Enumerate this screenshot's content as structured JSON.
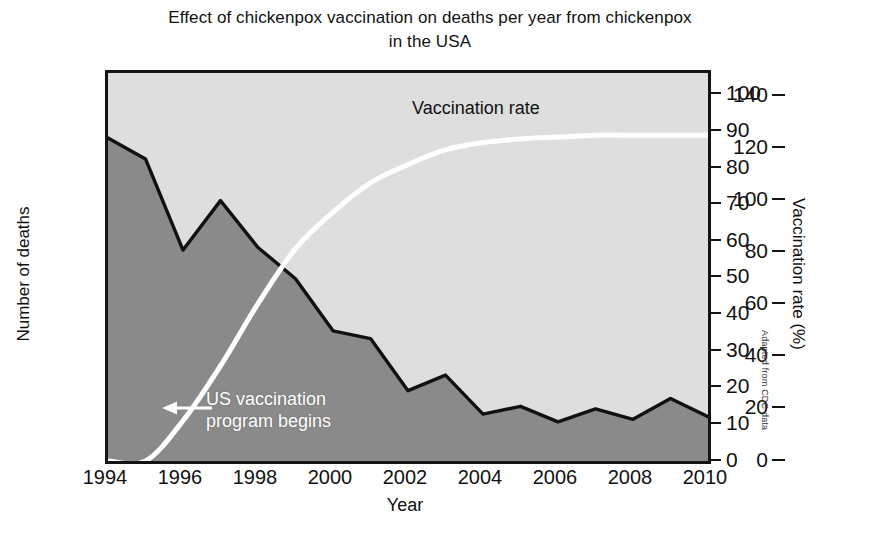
{
  "chart_data": {
    "type": "area",
    "title": "Effect of chickenpox vaccination on deaths per year from chickenpox in the USA",
    "title_line1": "Effect of chickenpox vaccination on deaths per year from chickenpox",
    "title_line2": "in the USA",
    "xlabel": "Year",
    "ylabel": "Number of deaths",
    "y2label": "Vaccination rate (%)",
    "x": [
      1994,
      1995,
      1996,
      1997,
      1998,
      1999,
      2000,
      2001,
      2002,
      2003,
      2004,
      2005,
      2006,
      2007,
      2008,
      2009,
      2010
    ],
    "xticks": [
      "1994",
      "1996",
      "1998",
      "2000",
      "2002",
      "2004",
      "2006",
      "2008",
      "2010"
    ],
    "xtick_values": [
      1994,
      1996,
      1998,
      2000,
      2002,
      2004,
      2006,
      2008,
      2010
    ],
    "xlim": [
      1994,
      2010
    ],
    "yticks": [
      "0",
      "20",
      "40",
      "60",
      "80",
      "100",
      "120",
      "140"
    ],
    "ytick_values": [
      0,
      20,
      40,
      60,
      80,
      100,
      120,
      140
    ],
    "ylim": [
      0,
      149
    ],
    "y2ticks": [
      "0",
      "10",
      "20",
      "30",
      "40",
      "50",
      "60",
      "70",
      "80",
      "90",
      "100"
    ],
    "y2tick_values": [
      0,
      10,
      20,
      30,
      40,
      50,
      60,
      70,
      80,
      90,
      100
    ],
    "y2lim": [
      0,
      106
    ],
    "grid": false,
    "series": [
      {
        "name": "Number of deaths",
        "axis": "left",
        "style": "filled-area",
        "fill_color": "#8a8a8a",
        "line_color": "#111111",
        "values": [
          124,
          116,
          81,
          100,
          82,
          70,
          50,
          47,
          27,
          33,
          18,
          21,
          15,
          20,
          16,
          24,
          17
        ]
      },
      {
        "name": "Vaccination rate",
        "axis": "right",
        "style": "line",
        "line_color": "#ffffff",
        "values": [
          0,
          0,
          11,
          26,
          43,
          58,
          68,
          76,
          81,
          85,
          87,
          88,
          88.5,
          89,
          89,
          89,
          89
        ]
      }
    ],
    "annotations": [
      {
        "name": "vaccination-rate-label",
        "text": "Vaccination rate",
        "x": 2001.2,
        "y2": 97
      },
      {
        "name": "program-annotation",
        "text_line1": "US vaccination",
        "text_line2": "program begins",
        "arrow": "left-arrow",
        "points_to_x": 1995.6,
        "color": "#ffffff"
      }
    ],
    "plot_background": "#dedede",
    "credit": "Adapted from CDC data"
  }
}
